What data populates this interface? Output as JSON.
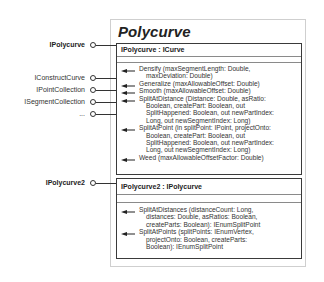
{
  "class": {
    "title": "Polycurve"
  },
  "interfaces_left": [
    {
      "label": "IPolycurve",
      "bold": true,
      "y": 45
    },
    {
      "label": "IConstructCurve",
      "bold": false,
      "y": 78
    },
    {
      "label": "IPointCollection",
      "bold": false,
      "y": 90
    },
    {
      "label": "ISegmentCollection",
      "bold": false,
      "y": 102
    },
    {
      "label": "...",
      "bold": false,
      "y": 114
    },
    {
      "label": "IPolycurve2",
      "bold": true,
      "y": 183
    }
  ],
  "interface_boxes": [
    {
      "header": "IPolycurve : ICurve",
      "methods": [
        {
          "first": "Densify (maxSegmentLength: Double,",
          "rest": [
            "maxDeviation: Double)"
          ]
        },
        {
          "first": "Generalize (maxAllowableOffset: Double)",
          "rest": []
        },
        {
          "first": "Smooth (maxAllowableOffset: Double)",
          "rest": []
        },
        {
          "first": "SplitAtDistance (Distance: Double, asRatio:",
          "rest": [
            "Boolean, createPart: Boolean, out",
            "SplitHappened: Boolean, out newPartIndex:",
            "Long, out newSegmentIndex: Long)"
          ]
        },
        {
          "first": "SplitAtPoint (in splitPoint: IPoint, projectOnto:",
          "rest": [
            "Boolean, createPart: Boolean, out",
            "SplitHappened: Boolean, out newPartIndex:",
            "Long, out newSegmentIndex: Long)"
          ]
        },
        {
          "first": "Weed (maxAllowableOffsetFactor: Double)",
          "rest": []
        }
      ]
    },
    {
      "header": "IPolycurve2 : IPolycurve",
      "methods": [
        {
          "first": "SplitAtDistances (distanceCount: Long,",
          "rest": [
            "distances: Double, asRatios: Boolean,",
            "createParts: Boolean): IEnumSplitPoint"
          ]
        },
        {
          "first": "SplitAtPoints (splitPoints: IEnumVertex,",
          "rest": [
            "projectOnto: Boolean, createParts:",
            "Boolean): IEnumSplitPoint"
          ]
        }
      ]
    }
  ]
}
